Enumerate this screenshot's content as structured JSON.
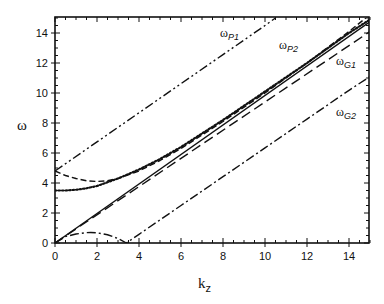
{
  "chart_data": {
    "type": "line",
    "title": "",
    "xlabel": "k_z",
    "ylabel": "ω",
    "xlim": [
      0,
      15
    ],
    "ylim": [
      0,
      15
    ],
    "xticks": [
      0,
      2,
      4,
      6,
      8,
      10,
      12,
      14
    ],
    "yticks": [
      0,
      2,
      4,
      6,
      8,
      10,
      12,
      14
    ],
    "grid": false,
    "legend": "inline labels",
    "annotations": [
      {
        "text": "ω",
        "sub": "P1",
        "x": 7.9,
        "y": 13.8
      },
      {
        "text": "ω",
        "sub": "P2",
        "x": 10.7,
        "y": 13.0
      },
      {
        "text": "ω",
        "sub": "G1",
        "x": 13.5,
        "y": 11.9
      },
      {
        "text": "ω",
        "sub": "G2",
        "x": 13.5,
        "y": 8.5
      }
    ],
    "series": [
      {
        "name": "ωP1",
        "style": "dash-dot-dot",
        "x": [
          0,
          2,
          4,
          6,
          8,
          10,
          10.5
        ],
        "y": [
          4.8,
          6.74,
          8.68,
          10.62,
          12.56,
          14.5,
          15.0
        ]
      },
      {
        "name": "ωP2",
        "style": "dashed",
        "x": [
          0,
          0.5,
          1,
          1.5,
          2,
          2.5,
          3,
          4,
          5,
          6,
          8,
          10,
          12,
          14,
          14.8
        ],
        "y": [
          4.8,
          4.5,
          4.3,
          4.15,
          4.1,
          4.15,
          4.3,
          4.8,
          5.5,
          6.3,
          8.1,
          10.0,
          12.0,
          14.1,
          15.0
        ]
      },
      {
        "name": "ωP2-lower",
        "style": "dotted",
        "x": [
          0,
          0.5,
          1,
          1.5,
          2,
          3,
          4,
          5,
          6,
          8,
          10,
          12,
          14,
          15
        ],
        "y": [
          3.5,
          3.5,
          3.55,
          3.65,
          3.8,
          4.3,
          4.9,
          5.6,
          6.4,
          8.2,
          10.1,
          12.0,
          14.0,
          14.9
        ]
      },
      {
        "name": "light-line",
        "style": "solid",
        "x": [
          0,
          15
        ],
        "y": [
          0,
          14.75
        ]
      },
      {
        "name": "ωG1",
        "style": "long-dashed",
        "x": [
          0,
          15
        ],
        "y": [
          0,
          14.1
        ]
      },
      {
        "name": "ωG2",
        "style": "dash-dot",
        "x": [
          0,
          0.5,
          1,
          1.5,
          1.7,
          2,
          2.5,
          3,
          3.4,
          4,
          6,
          8,
          10,
          12,
          14,
          15
        ],
        "y": [
          0,
          0.43,
          0.6,
          0.69,
          0.7,
          0.68,
          0.55,
          0.3,
          0,
          0.58,
          2.5,
          4.42,
          6.34,
          8.26,
          10.18,
          11.1
        ]
      }
    ]
  },
  "axes": {
    "xlabel_main": "k",
    "xlabel_sub": "z",
    "ylabel": "ω",
    "xtick_labels": [
      "0",
      "2",
      "4",
      "6",
      "8",
      "10",
      "12",
      "14"
    ],
    "ytick_labels": [
      "0",
      "2",
      "4",
      "6",
      "8",
      "10",
      "12",
      "14"
    ]
  },
  "labels": {
    "p1": {
      "main": "ω",
      "sub": "P1"
    },
    "p2": {
      "main": "ω",
      "sub": "P2"
    },
    "g1": {
      "main": "ω",
      "sub": "G1"
    },
    "g2": {
      "main": "ω",
      "sub": "G2"
    }
  }
}
